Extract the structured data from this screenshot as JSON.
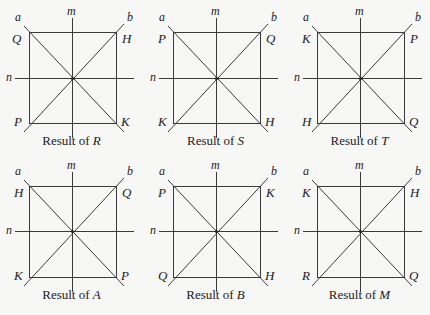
{
  "axes": {
    "a": "a",
    "b": "b",
    "m": "m",
    "n": "n"
  },
  "caption_prefix": "Result of ",
  "colors": {
    "line": "#3a3a3a",
    "background": "#f7f7f5"
  },
  "panels": [
    {
      "transform": "R",
      "corners": {
        "top_left": "Q",
        "top_right": "H",
        "bottom_left": "P",
        "bottom_right": "K"
      }
    },
    {
      "transform": "S",
      "corners": {
        "top_left": "P",
        "top_right": "Q",
        "bottom_left": "K",
        "bottom_right": "H"
      }
    },
    {
      "transform": "T",
      "corners": {
        "top_left": "K",
        "top_right": "P",
        "bottom_left": "H",
        "bottom_right": "Q"
      }
    },
    {
      "transform": "A",
      "corners": {
        "top_left": "H",
        "top_right": "Q",
        "bottom_left": "K",
        "bottom_right": "P"
      }
    },
    {
      "transform": "B",
      "corners": {
        "top_left": "P",
        "top_right": "K",
        "bottom_left": "Q",
        "bottom_right": "H"
      }
    },
    {
      "transform": "M",
      "corners": {
        "top_left": "K",
        "top_right": "H",
        "bottom_left": "R",
        "bottom_right": "Q"
      }
    }
  ]
}
